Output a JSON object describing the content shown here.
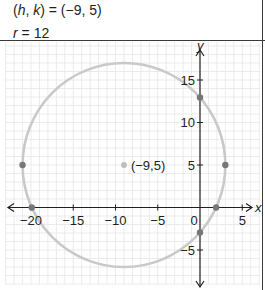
{
  "equation": {
    "center_lhs_h": "h",
    "center_lhs_sep": ", ",
    "center_lhs_k": "k",
    "center_rhs": ") = (−9, 5)",
    "center_open": "(",
    "radius_var": "r",
    "radius_rhs": " = 12"
  },
  "chart_data": {
    "type": "scatter",
    "title": "",
    "xlabel": "x",
    "ylabel": "y",
    "xlim": [
      -23,
      7
    ],
    "ylim": [
      -9,
      19.5
    ],
    "grid": true,
    "x_ticks": [
      -20,
      -15,
      -10,
      -5,
      0,
      5
    ],
    "x_tick_labels": [
      "−20",
      "−15",
      "−10",
      "−5",
      "0",
      "5"
    ],
    "y_ticks": [
      -5,
      5,
      10,
      15
    ],
    "y_tick_labels": [
      "−5",
      "5",
      "10",
      "15"
    ],
    "circle": {
      "h": -9,
      "k": 5,
      "r": 12,
      "color": "#c9c9c9"
    },
    "center_point": {
      "x": -9,
      "y": 5,
      "label": "(−9,5)",
      "color": "#bdbdbd"
    },
    "points": [
      {
        "x": -21,
        "y": 5
      },
      {
        "x": 3,
        "y": 5
      },
      {
        "x": 0,
        "y": 12.94
      },
      {
        "x": 0,
        "y": -2.94
      },
      {
        "x": -19.91,
        "y": 0
      },
      {
        "x": 1.91,
        "y": 0
      }
    ],
    "point_color": "#777777",
    "grid_color": "#e6e6e6",
    "axis_color": "#231f20"
  }
}
